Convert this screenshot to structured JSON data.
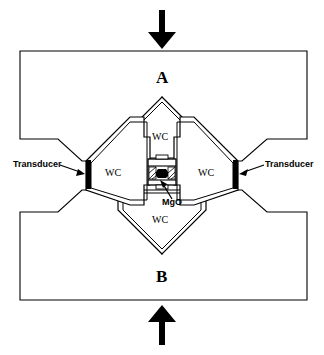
{
  "figure": {
    "background_color": "#ffffff",
    "line_color": "#000000",
    "fill_color": "#ffffff",
    "transducer_color": "#000000",
    "sample_color": "#000000"
  },
  "blocks": {
    "top": {
      "label": "A",
      "name": "block-a"
    },
    "bottom": {
      "label": "B",
      "name": "block-b"
    }
  },
  "arrows": {
    "top": {
      "direction": "down",
      "meaning": "applied load"
    },
    "bottom": {
      "direction": "up",
      "meaning": "applied load"
    }
  },
  "anvils": [
    {
      "position": "top",
      "label": "WC"
    },
    {
      "position": "left",
      "label": "WC"
    },
    {
      "position": "right",
      "label": "WC"
    },
    {
      "position": "bottom",
      "label": "WC"
    }
  ],
  "sample": {
    "label": "MgO"
  },
  "transducers": [
    {
      "position": "left",
      "label": "Transducer"
    },
    {
      "position": "right",
      "label": "Transducer"
    }
  ],
  "caption": {
    "text": ""
  }
}
